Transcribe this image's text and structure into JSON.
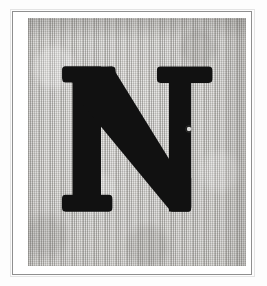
{
  "image": {
    "kind": "scanned-initial-letter-plate",
    "letter": "N",
    "letter_case": "uppercase",
    "typeface_style": "slab-serif display",
    "description": "Scanned printed plate of a bold slab-serif capital letter N on a textured gray ground, enclosed by a thin rectangular rule on a white page."
  },
  "colors": {
    "page_background": "#fdfdfd",
    "frame_rule": "#8f8f8f",
    "frame_inner_white": "#ffffff",
    "plate_field": "#c6c5c2",
    "letter_ink": "#111111",
    "defect_speck": "#e8e8e6"
  },
  "layout": {
    "canvas_width": 267,
    "canvas_height": 286,
    "frame": {
      "x": 12,
      "y": 11,
      "width": 240,
      "height": 264
    },
    "field": {
      "x": 28,
      "y": 18,
      "width": 218,
      "height": 248
    },
    "letter_bounds": {
      "x": 62,
      "y": 66,
      "width": 153,
      "height": 146
    }
  },
  "defects": [
    {
      "name": "white-speck",
      "x": 189,
      "y": 129,
      "radius": 2.2,
      "note": "small light pinhole in the right stem of the letter"
    }
  ],
  "accessibility": {
    "alt_text": "Capital letter N"
  }
}
